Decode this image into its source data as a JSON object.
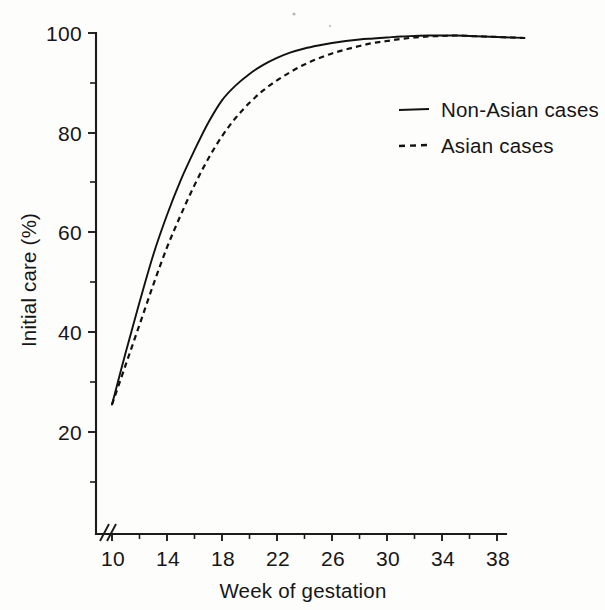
{
  "figure": {
    "background_color": "#fdfdfc",
    "ink_color": "#111111"
  },
  "axes": {
    "x_title": "Week of gestation",
    "y_title": "Initial care (%)",
    "x_ticks": [
      "10",
      "14",
      "18",
      "22",
      "26",
      "30",
      "34",
      "38"
    ],
    "y_ticks": [
      "20",
      "40",
      "60",
      "80",
      "100"
    ],
    "axis_break_symbol": "//"
  },
  "legend": {
    "entries": [
      {
        "label": "Non-Asian cases",
        "style": "solid"
      },
      {
        "label": "Asian cases",
        "style": "dashed"
      }
    ]
  },
  "chart_data": {
    "type": "line",
    "title": "",
    "subtitle": "",
    "xlabel": "Week of gestation",
    "ylabel": "Initial care (%)",
    "xlim": [
      9,
      40.5
    ],
    "ylim": [
      0,
      100
    ],
    "xticks": [
      10,
      14,
      18,
      22,
      26,
      30,
      34,
      38
    ],
    "yticks": [
      20,
      40,
      60,
      80,
      100
    ],
    "x_minor_tick_interval": 2,
    "y_minor_tick_interval": 10,
    "grid": false,
    "legend_position": "upper right",
    "axis_break": {
      "axis": "x",
      "location": "origin",
      "symbol": "//"
    },
    "x": [
      10,
      11,
      12,
      13,
      14,
      15,
      16,
      17,
      18,
      19,
      20,
      21,
      22,
      23,
      24,
      25,
      26,
      27,
      28,
      29,
      30,
      31,
      32,
      33,
      34,
      35,
      36,
      37,
      38,
      39,
      40
    ],
    "series": [
      {
        "name": "Non-Asian cases",
        "style": "solid",
        "values": [
          25.5,
          36.0,
          46.0,
          55.5,
          63.5,
          70.5,
          76.5,
          82.0,
          86.5,
          89.5,
          91.8,
          93.6,
          95.0,
          96.1,
          96.9,
          97.5,
          98.0,
          98.4,
          98.7,
          98.9,
          99.1,
          99.3,
          99.4,
          99.5,
          99.5,
          99.5,
          99.4,
          99.3,
          99.2,
          99.1,
          99.0
        ]
      },
      {
        "name": "Asian cases",
        "style": "dashed",
        "values": [
          25.5,
          33.5,
          41.5,
          49.5,
          57.0,
          63.5,
          69.5,
          74.8,
          79.3,
          83.0,
          86.0,
          88.5,
          90.5,
          92.2,
          93.7,
          94.9,
          95.9,
          96.7,
          97.4,
          98.0,
          98.4,
          98.8,
          99.1,
          99.3,
          99.4,
          99.5,
          99.4,
          99.3,
          99.2,
          99.1,
          99.0
        ]
      }
    ]
  }
}
